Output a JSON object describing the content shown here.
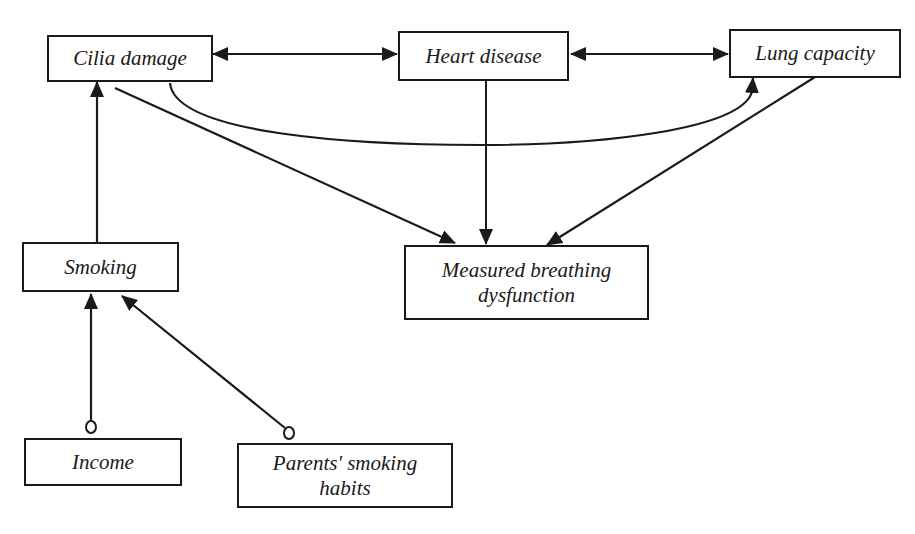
{
  "diagram": {
    "nodes": {
      "cilia_damage": {
        "label": "Cilia damage"
      },
      "heart_disease": {
        "label": "Heart disease"
      },
      "lung_capacity": {
        "label": "Lung capacity"
      },
      "smoking": {
        "label": "Smoking"
      },
      "measured_breathing": {
        "label": "Measured breathing\ndysfunction"
      },
      "income": {
        "label": "Income"
      },
      "parents_smoking": {
        "label": "Parents' smoking\nhabits"
      }
    },
    "edges": [
      {
        "from": "Cilia damage",
        "to": "Heart disease",
        "type": "bidirected"
      },
      {
        "from": "Heart disease",
        "to": "Lung capacity",
        "type": "bidirected"
      },
      {
        "from": "Cilia damage",
        "to": "Lung capacity",
        "type": "directed-curved"
      },
      {
        "from": "Cilia damage",
        "to": "Measured breathing dysfunction",
        "type": "directed"
      },
      {
        "from": "Heart disease",
        "to": "Measured breathing dysfunction",
        "type": "directed"
      },
      {
        "from": "Lung capacity",
        "to": "Measured breathing dysfunction",
        "type": "directed"
      },
      {
        "from": "Smoking",
        "to": "Cilia damage",
        "type": "directed"
      },
      {
        "from": "Income",
        "to": "Smoking",
        "type": "circle-tail-directed"
      },
      {
        "from": "Parents' smoking habits",
        "to": "Smoking",
        "type": "circle-tail-directed"
      }
    ],
    "colors": {
      "stroke": "#1a1a1a",
      "background": "#ffffff"
    }
  }
}
